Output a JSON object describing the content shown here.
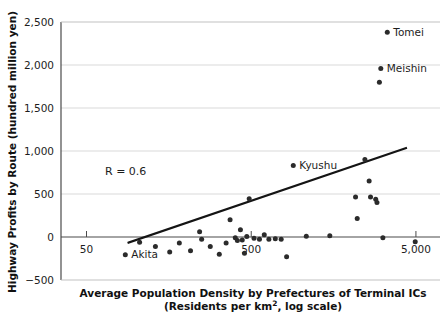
{
  "chart_data": {
    "type": "scatter",
    "title": "",
    "xlabel": "Average Population Density by Prefectures of Terminal ICs (Residents per km2, log scale)",
    "xlabel_line1": "Average Population Density by Prefectures of Terminal ICs",
    "xlabel_line2_pre": "(Residents per km",
    "xlabel_line2_sup": "2",
    "xlabel_line2_post": ", log scale)",
    "ylabel": "Highway Profits by Route (hundred million yen)",
    "x_scale": "log",
    "xlim": [
      35,
      7000
    ],
    "ylim": [
      -500,
      2500
    ],
    "xticks": [
      50,
      500,
      5000
    ],
    "xtick_labels": [
      "50",
      "500",
      "5,000"
    ],
    "yticks": [
      -500,
      0,
      500,
      1000,
      1500,
      2000,
      2500
    ],
    "ytick_labels": [
      "−500",
      "0",
      "500",
      "1,000",
      "1,500",
      "2,000",
      "2,500"
    ],
    "grid": "horizontal",
    "legend": "none",
    "annotations": [
      {
        "text": "R = 0.6",
        "x_px": 105,
        "y_px": 175
      }
    ],
    "trend_line": {
      "x_start": 90,
      "y_start": -65,
      "x_end": 4350,
      "y_end": 1035
    },
    "points": [
      {
        "x": 105,
        "y": -60,
        "label": ""
      },
      {
        "x": 86,
        "y": -205,
        "label": "Akita"
      },
      {
        "x": 131,
        "y": -110,
        "label": ""
      },
      {
        "x": 160,
        "y": -175,
        "label": ""
      },
      {
        "x": 183,
        "y": -70,
        "label": ""
      },
      {
        "x": 214,
        "y": -160,
        "label": ""
      },
      {
        "x": 243,
        "y": 60,
        "label": ""
      },
      {
        "x": 250,
        "y": -25,
        "label": ""
      },
      {
        "x": 282,
        "y": -110,
        "label": ""
      },
      {
        "x": 320,
        "y": -200,
        "label": ""
      },
      {
        "x": 352,
        "y": -70,
        "label": ""
      },
      {
        "x": 372,
        "y": 200,
        "label": ""
      },
      {
        "x": 400,
        "y": -10,
        "label": ""
      },
      {
        "x": 412,
        "y": -40,
        "label": ""
      },
      {
        "x": 430,
        "y": 85,
        "label": ""
      },
      {
        "x": 441,
        "y": -35,
        "label": ""
      },
      {
        "x": 455,
        "y": -190,
        "label": ""
      },
      {
        "x": 470,
        "y": 5,
        "label": ""
      },
      {
        "x": 486,
        "y": 445,
        "label": ""
      },
      {
        "x": 520,
        "y": -15,
        "label": ""
      },
      {
        "x": 561,
        "y": -25,
        "label": ""
      },
      {
        "x": 600,
        "y": 25,
        "label": ""
      },
      {
        "x": 640,
        "y": -25,
        "label": ""
      },
      {
        "x": 700,
        "y": -20,
        "label": ""
      },
      {
        "x": 760,
        "y": -25,
        "label": ""
      },
      {
        "x": 820,
        "y": -230,
        "label": ""
      },
      {
        "x": 900,
        "y": 830,
        "label": "Kyushu"
      },
      {
        "x": 1080,
        "y": 10,
        "label": ""
      },
      {
        "x": 1500,
        "y": 15,
        "label": ""
      },
      {
        "x": 2150,
        "y": 465,
        "label": ""
      },
      {
        "x": 2200,
        "y": 215,
        "label": ""
      },
      {
        "x": 2450,
        "y": 900,
        "label": ""
      },
      {
        "x": 2600,
        "y": 650,
        "label": ""
      },
      {
        "x": 2650,
        "y": 465,
        "label": ""
      },
      {
        "x": 2850,
        "y": 440,
        "label": ""
      },
      {
        "x": 2900,
        "y": 400,
        "label": ""
      },
      {
        "x": 3000,
        "y": 1800,
        "label": ""
      },
      {
        "x": 3060,
        "y": 1960,
        "label": "Meishin"
      },
      {
        "x": 3350,
        "y": 2380,
        "label": "Tomei"
      },
      {
        "x": 3150,
        "y": -10,
        "label": ""
      },
      {
        "x": 4950,
        "y": -55,
        "label": ""
      }
    ]
  }
}
